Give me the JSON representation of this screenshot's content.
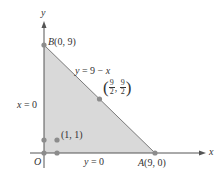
{
  "diagram": {
    "type": "coordinate-region",
    "axes": {
      "x_label": "x",
      "y_label": "y",
      "origin_label": "O"
    },
    "region": {
      "description": "Triangular region bounded by x = 0, y = 0, and y = 9 - x",
      "fill_color": "#d9d9d9",
      "edge_color": "#808080"
    },
    "boundaries": [
      {
        "label": "y = 9 − x",
        "prefix": "y",
        "rest": " = 9 − ",
        "var": "x"
      },
      {
        "label": "x = 0",
        "var": "x",
        "rest": " = 0"
      },
      {
        "label": "y = 0",
        "var": "y",
        "rest": " = 0"
      }
    ],
    "points": [
      {
        "name": "B",
        "label": "B(0, 9)",
        "letter": "B",
        "coords": "(0, 9)",
        "x": 0,
        "y": 9
      },
      {
        "name": "A",
        "label": "A(9, 0)",
        "letter": "A",
        "coords": "(9, 0)",
        "x": 9,
        "y": 0
      },
      {
        "name": "midpoint",
        "label": "(9/2, 9/2)",
        "num1": "9",
        "den1": "2",
        "num2": "9",
        "den2": "2",
        "x": 4.5,
        "y": 4.5
      },
      {
        "name": "p11",
        "label": "(1, 1)",
        "x": 1,
        "y": 1
      },
      {
        "name": "p01",
        "x": 0,
        "y": 1
      },
      {
        "name": "p00",
        "x": 0,
        "y": 0
      },
      {
        "name": "p10",
        "x": 1,
        "y": 0
      }
    ],
    "point_color": "#8c8c8c"
  }
}
